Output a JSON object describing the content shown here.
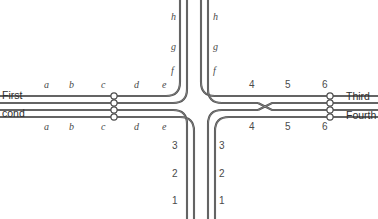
{
  "figure": {
    "type": "wiring-crossover-diagram",
    "line_color": "#4d4d4d",
    "line_highlight": "#8c8c8c",
    "terminal_fill": "#ffffff",
    "terminal_stroke": "#4d4d4d",
    "background": "#ffffff"
  },
  "side_labels": {
    "left_line1": "First",
    "left_line2": "cond",
    "right_line1": "Third",
    "right_line2": "Fourth"
  },
  "left_top_segments": [
    "a",
    "b",
    "c",
    "d",
    "e"
  ],
  "left_bottom_segments": [
    "a",
    "b",
    "c",
    "d",
    "e"
  ],
  "right_top_segments": [
    "4",
    "5",
    "6"
  ],
  "right_bottom_segments": [
    "4",
    "5",
    "6"
  ],
  "top_left_segments": [
    "f",
    "g",
    "h"
  ],
  "top_right_segments": [
    "f",
    "g",
    "h"
  ],
  "bottom_left_segments": [
    "1",
    "2",
    "3"
  ],
  "bottom_right_segments": [
    "1",
    "2",
    "3"
  ],
  "positions": {
    "left_top_x": [
      44,
      69,
      101,
      134,
      162
    ],
    "left_top_y": 80,
    "left_bottom_x": [
      44,
      69,
      101,
      134,
      162
    ],
    "left_bottom_y": 130,
    "right_top_x": [
      249,
      285,
      322
    ],
    "right_top_y": 80,
    "right_bottom_x": [
      249,
      285,
      322
    ],
    "right_bottom_y": 130,
    "top_left_x": 182,
    "top_left_y": [
      70,
      50,
      20
    ],
    "top_right_x": 213,
    "top_right_y": [
      70,
      50,
      20
    ],
    "bottom_left_x": 182,
    "bottom_left_y": [
      198,
      173,
      145
    ],
    "bottom_right_x": 213,
    "bottom_right_y": [
      198,
      173,
      145
    ],
    "side_left_x": 2,
    "side_left_y1": 90,
    "side_left_y2": 108,
    "side_right_x": 346,
    "side_right_y1": 91,
    "side_right_y2": 110
  },
  "terminals": {
    "left_count": 4,
    "right_count": 4,
    "left_x": 114,
    "right_x": 330,
    "y_values": [
      96,
      103,
      110,
      117
    ],
    "radius": 3.1
  },
  "crossover": {
    "present": true,
    "center_x": 265,
    "center_y": 106.5,
    "half_width": 6,
    "description": "middle two conductors cross"
  }
}
